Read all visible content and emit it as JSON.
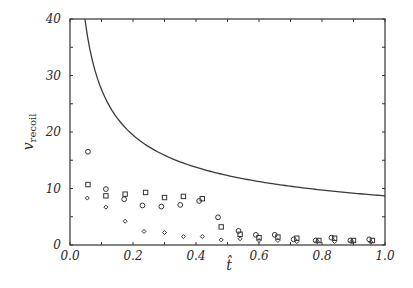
{
  "chart_data": {
    "type": "scatter",
    "title": "",
    "xlabel": "t̂",
    "ylabel": "v_recoil",
    "ylabel_main": "v",
    "ylabel_sub": "recoil",
    "xlim": [
      0.0,
      1.0
    ],
    "ylim": [
      0,
      40
    ],
    "grid": false,
    "legend": null,
    "x_ticks": [
      "0.0",
      "0.2",
      "0.4",
      "0.6",
      "0.8",
      "1.0"
    ],
    "y_ticks": [
      "0",
      "10",
      "20",
      "30",
      "40"
    ],
    "x_minor_step": 0.1,
    "y_minor_step": 5,
    "curve": {
      "name": "bound",
      "style": "line",
      "formula": "v = 8.7 / sqrt(t)",
      "x": [
        0.047,
        0.06,
        0.08,
        0.1,
        0.125,
        0.15,
        0.2,
        0.25,
        0.3,
        0.4,
        0.5,
        0.6,
        0.7,
        0.8,
        0.9,
        1.0
      ],
      "y": [
        40.0,
        35.5,
        30.8,
        27.5,
        24.6,
        22.5,
        19.5,
        17.4,
        15.9,
        13.8,
        12.3,
        11.2,
        10.4,
        9.7,
        9.2,
        8.7
      ]
    },
    "series": [
      {
        "name": "circles",
        "marker": "circle",
        "x": [
          0.057,
          0.114,
          0.172,
          0.23,
          0.29,
          0.35,
          0.41,
          0.47,
          0.535,
          0.59,
          0.65,
          0.71,
          0.78,
          0.83,
          0.89,
          0.95
        ],
        "y": [
          16.5,
          9.9,
          8.1,
          7.0,
          6.8,
          7.1,
          7.8,
          4.9,
          2.5,
          1.8,
          1.8,
          1.0,
          0.8,
          1.3,
          0.8,
          1.0
        ]
      },
      {
        "name": "squares",
        "marker": "square",
        "x": [
          0.057,
          0.114,
          0.175,
          0.24,
          0.3,
          0.36,
          0.42,
          0.48,
          0.54,
          0.6,
          0.66,
          0.72,
          0.79,
          0.84,
          0.9,
          0.96
        ],
        "y": [
          10.7,
          8.7,
          9.0,
          9.3,
          8.4,
          8.6,
          8.2,
          3.2,
          1.9,
          1.3,
          1.4,
          1.2,
          0.8,
          1.2,
          0.8,
          0.8
        ]
      },
      {
        "name": "diamonds",
        "marker": "diamond",
        "x": [
          0.055,
          0.114,
          0.175,
          0.235,
          0.3,
          0.36,
          0.42,
          0.48,
          0.54,
          0.6,
          0.66,
          0.72,
          0.785,
          0.84,
          0.895,
          0.955
        ],
        "y": [
          8.3,
          6.7,
          4.2,
          2.4,
          2.2,
          1.5,
          1.5,
          0.9,
          1.1,
          0.8,
          0.8,
          0.6,
          0.6,
          0.6,
          0.6,
          0.5
        ]
      }
    ]
  },
  "style": {
    "ink": "#333333",
    "curve_color": "#3a3a3a"
  },
  "layout": {
    "plot_left": 70,
    "plot_right": 385,
    "plot_top": 19,
    "plot_bottom": 245
  }
}
